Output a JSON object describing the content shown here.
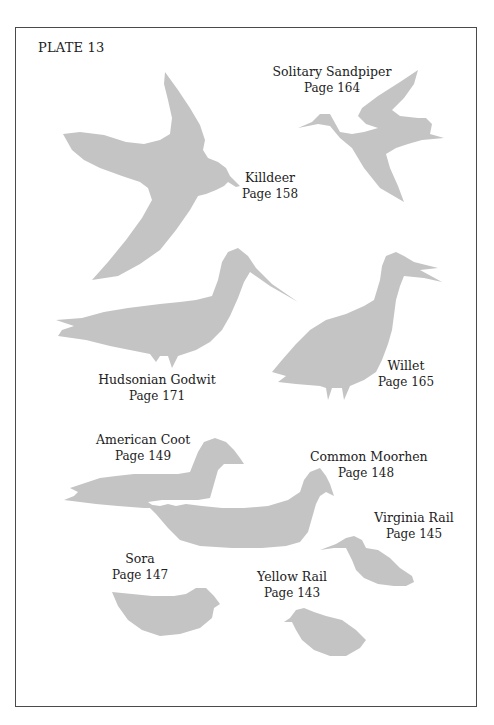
{
  "plate": {
    "title": "PLATE 13"
  },
  "colors": {
    "silhouette": "#c4c4c4",
    "border": "#4a4a4a",
    "text": "#222222"
  },
  "birds": [
    {
      "name": "Solitary Sandpiper",
      "page": "Page 164"
    },
    {
      "name": "Killdeer",
      "page": "Page 158"
    },
    {
      "name": "Hudsonian Godwit",
      "page": "Page 171"
    },
    {
      "name": "Willet",
      "page": "Page 165"
    },
    {
      "name": "American Coot",
      "page": "Page 149"
    },
    {
      "name": "Common Moorhen",
      "page": "Page 148"
    },
    {
      "name": "Virginia Rail",
      "page": "Page 145"
    },
    {
      "name": "Sora",
      "page": "Page 147"
    },
    {
      "name": "Yellow Rail",
      "page": "Page 143"
    }
  ]
}
